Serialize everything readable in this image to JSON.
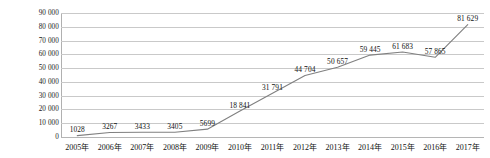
{
  "chart_data": {
    "type": "line",
    "title": "",
    "subtitle": "",
    "xlabel": "",
    "ylabel": "",
    "categories": [
      "2005年",
      "2006年",
      "2007年",
      "2008年",
      "2009年",
      "2010年",
      "2011年",
      "2012年",
      "2013年",
      "2014年",
      "2015年",
      "2016年",
      "2017年"
    ],
    "values": [
      1028,
      3267,
      3433,
      3405,
      5699,
      18841,
      31791,
      44704,
      50657,
      59445,
      61683,
      57865,
      81629
    ],
    "data_labels": [
      "1028",
      "3267",
      "3433",
      "3405",
      "5699",
      "18 841",
      "31 791",
      "44 704",
      "50 657",
      "59 445",
      "61 683",
      "57 865",
      "81 629"
    ],
    "ylim": [
      0,
      90000
    ],
    "ytick_values": [
      0,
      10000,
      20000,
      30000,
      40000,
      50000,
      60000,
      70000,
      80000,
      90000
    ],
    "ytick_labels": [
      "0",
      "10 000",
      "20 000",
      "30 000",
      "40 000",
      "50 000",
      "60 000",
      "70 000",
      "80 000",
      "90 000"
    ],
    "grid": true,
    "grid_axis": "y",
    "legend": false,
    "legend_position": "none",
    "markers": false,
    "series_color": "#808080",
    "grid_color": "#c9c9c9",
    "axis_color": "#b0b0b0",
    "text_color": "#111111"
  }
}
